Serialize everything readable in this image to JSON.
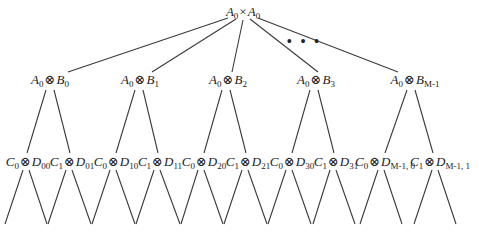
{
  "root": {
    "a": "A",
    "a_sub": "0",
    "op": "×",
    "b": "A",
    "b_sub": "0",
    "x": 243,
    "y": 5
  },
  "ellipsis": {
    "text": "• • •",
    "x": 304,
    "y": 33
  },
  "level1": [
    {
      "a": "A",
      "a_sub": "0",
      "op": "⊗",
      "b": "B",
      "b_sub": "0",
      "x": 50,
      "y": 73
    },
    {
      "a": "A",
      "a_sub": "0",
      "op": "⊗",
      "b": "B",
      "b_sub": "1",
      "x": 140,
      "y": 73
    },
    {
      "a": "A",
      "a_sub": "0",
      "op": "⊗",
      "b": "B",
      "b_sub": "2",
      "x": 228,
      "y": 73
    },
    {
      "a": "A",
      "a_sub": "0",
      "op": "⊗",
      "b": "B",
      "b_sub": "3",
      "x": 316,
      "y": 73
    },
    {
      "a": "A",
      "a_sub": "0",
      "op": "⊗",
      "b": "B",
      "b_sub": "M-1",
      "x": 415,
      "y": 73
    }
  ],
  "level2": [
    {
      "a": "C",
      "a_sub": "0",
      "op": "⊗",
      "b": "D",
      "b_sub": "00",
      "x": 28,
      "y": 155
    },
    {
      "a": "C",
      "a_sub": "1",
      "op": "⊗",
      "b": "D",
      "b_sub": "01",
      "x": 72,
      "y": 155
    },
    {
      "a": "C",
      "a_sub": "0",
      "op": "⊗",
      "b": "D",
      "b_sub": "10",
      "x": 116,
      "y": 155
    },
    {
      "a": "C",
      "a_sub": "1",
      "op": "⊗",
      "b": "D",
      "b_sub": "11",
      "x": 160,
      "y": 155
    },
    {
      "a": "C",
      "a_sub": "0",
      "op": "⊗",
      "b": "D",
      "b_sub": "20",
      "x": 204,
      "y": 155
    },
    {
      "a": "C",
      "a_sub": "1",
      "op": "⊗",
      "b": "D",
      "b_sub": "21",
      "x": 248,
      "y": 155
    },
    {
      "a": "C",
      "a_sub": "0",
      "op": "⊗",
      "b": "D",
      "b_sub": "30",
      "x": 292,
      "y": 155
    },
    {
      "a": "C",
      "a_sub": "1",
      "op": "⊗",
      "b": "D",
      "b_sub": "31",
      "x": 336,
      "y": 155
    },
    {
      "a": "C",
      "a_sub": "0",
      "op": "⊗",
      "b": "D",
      "b_sub": "M-1, 0",
      "x": 385,
      "y": 155
    },
    {
      "a": "C",
      "a_sub": "1",
      "op": "⊗",
      "b": "D",
      "b_sub": "M-1, 1",
      "x": 440,
      "y": 155
    }
  ]
}
